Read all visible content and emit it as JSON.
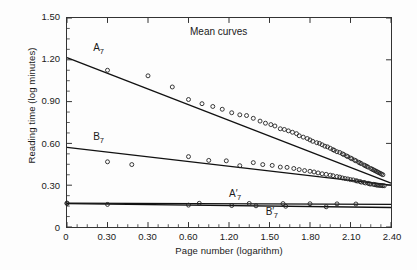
{
  "chart_data": {
    "type": "scatter",
    "title": "Mean curves",
    "xlabel": "Page number (logarithm)",
    "ylabel": "Reading time (log minutes)",
    "xlim": [
      0,
      2.4
    ],
    "ylim": [
      0,
      1.5
    ],
    "xticks": [
      "0",
      "0.30",
      "0.30",
      "0.60",
      "1.20",
      "1.50",
      "1.80",
      "2.10",
      "2.40"
    ],
    "xtick_values": [
      0,
      0.3,
      0.6,
      0.9,
      1.2,
      1.5,
      1.8,
      2.1,
      2.4
    ],
    "yticks": [
      "0",
      "0.30",
      "0.60",
      "0.90",
      "1.20",
      "1.50"
    ],
    "ytick_values": [
      0,
      0.3,
      0.6,
      0.9,
      1.2,
      1.5
    ],
    "grid": false,
    "legend": "inline-annotations",
    "minor_ticks_per_interval": 3,
    "marker": "open-circle",
    "series": [
      {
        "name": "A7",
        "label": "A",
        "subscript": "7",
        "prime": false,
        "fit_line": {
          "x0": 0.0,
          "y0": 1.215,
          "x1": 2.4,
          "y1": 0.315
        },
        "points_x": [
          0.3,
          0.6,
          0.78,
          0.9,
          1.0,
          1.08,
          1.15,
          1.22,
          1.28,
          1.33,
          1.38,
          1.43,
          1.47,
          1.51,
          1.54,
          1.58,
          1.61,
          1.64,
          1.67,
          1.7,
          1.72,
          1.75,
          1.78,
          1.8,
          1.82,
          1.85,
          1.87,
          1.89,
          1.91,
          1.93,
          1.95,
          1.97,
          1.98,
          2.0,
          2.02,
          2.04,
          2.05,
          2.07,
          2.08,
          2.1,
          2.11,
          2.13,
          2.14,
          2.16,
          2.17,
          2.18,
          2.2,
          2.21,
          2.22,
          2.23,
          2.25,
          2.26,
          2.27,
          2.28,
          2.29,
          2.3,
          2.31,
          2.32,
          2.33,
          2.34
        ],
        "points_y": [
          1.125,
          1.085,
          1.005,
          0.915,
          0.885,
          0.865,
          0.845,
          0.82,
          0.805,
          0.8,
          0.78,
          0.76,
          0.745,
          0.735,
          0.725,
          0.705,
          0.7,
          0.69,
          0.68,
          0.67,
          0.655,
          0.645,
          0.635,
          0.625,
          0.615,
          0.605,
          0.6,
          0.59,
          0.58,
          0.575,
          0.565,
          0.555,
          0.55,
          0.54,
          0.535,
          0.525,
          0.52,
          0.51,
          0.505,
          0.495,
          0.49,
          0.48,
          0.475,
          0.465,
          0.46,
          0.455,
          0.445,
          0.44,
          0.435,
          0.43,
          0.42,
          0.415,
          0.41,
          0.405,
          0.4,
          0.395,
          0.39,
          0.385,
          0.38,
          0.375
        ]
      },
      {
        "name": "B7",
        "label": "B",
        "subscript": "7",
        "prime": false,
        "fit_line": {
          "x0": 0.0,
          "y0": 0.572,
          "x1": 2.4,
          "y1": 0.3
        },
        "points_x": [
          0.3,
          0.48,
          0.9,
          1.05,
          1.18,
          1.28,
          1.38,
          1.45,
          1.52,
          1.58,
          1.63,
          1.68,
          1.72,
          1.76,
          1.8,
          1.83,
          1.86,
          1.89,
          1.92,
          1.95,
          1.97,
          2.0,
          2.02,
          2.04,
          2.06,
          2.08,
          2.1,
          2.12,
          2.14,
          2.15,
          2.17,
          2.18,
          2.2,
          2.21,
          2.23,
          2.24,
          2.25,
          2.27,
          2.28,
          2.29,
          2.3,
          2.31,
          2.32,
          2.33,
          2.34,
          2.35
        ],
        "points_y": [
          0.468,
          0.448,
          0.505,
          0.478,
          0.475,
          0.44,
          0.462,
          0.448,
          0.442,
          0.43,
          0.428,
          0.42,
          0.412,
          0.405,
          0.4,
          0.395,
          0.388,
          0.382,
          0.378,
          0.372,
          0.368,
          0.362,
          0.358,
          0.352,
          0.348,
          0.345,
          0.34,
          0.338,
          0.332,
          0.33,
          0.326,
          0.322,
          0.32,
          0.316,
          0.314,
          0.31,
          0.308,
          0.306,
          0.304,
          0.302,
          0.3,
          0.3,
          0.298,
          0.298,
          0.296,
          0.296
        ]
      },
      {
        "name": "A'7",
        "label": "A",
        "subscript": "7",
        "prime": true,
        "fit_line": {
          "x0": 0.0,
          "y0": 0.172,
          "x1": 2.4,
          "y1": 0.163
        },
        "points_x": [
          0.0,
          0.98,
          1.35,
          1.6,
          1.8,
          2.0,
          2.14
        ],
        "points_y": [
          0.172,
          0.17,
          0.169,
          0.168,
          0.167,
          0.166,
          0.165
        ]
      },
      {
        "name": "B'7",
        "label": "B",
        "subscript": "7",
        "prime": true,
        "fit_line": {
          "x0": 0.0,
          "y0": 0.168,
          "x1": 2.4,
          "y1": 0.14
        },
        "points_x": [
          0.0,
          0.3,
          0.9,
          1.22,
          1.4,
          1.62,
          1.92
        ],
        "points_y": [
          0.168,
          0.162,
          0.157,
          0.154,
          0.152,
          0.149,
          0.145
        ]
      }
    ],
    "annotations": [
      {
        "name": "A7",
        "text": "A",
        "sub": "7",
        "prime": false,
        "x": 0.2,
        "y": 1.27
      },
      {
        "name": "B7",
        "text": "B",
        "sub": "7",
        "prime": false,
        "x": 0.2,
        "y": 0.64
      },
      {
        "name": "A'7",
        "text": "A",
        "sub": "7",
        "prime": true,
        "x": 1.2,
        "y": 0.235
      },
      {
        "name": "B'7",
        "text": "B",
        "sub": "7",
        "prime": true,
        "x": 1.47,
        "y": 0.105
      }
    ],
    "colors": {
      "axis": "#333333",
      "line": "#111111",
      "marker": "#222222",
      "background": "#fdfdfd"
    }
  }
}
